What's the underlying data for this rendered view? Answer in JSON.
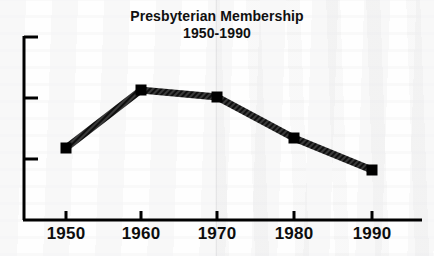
{
  "chart_data": {
    "type": "line",
    "title": "Presbyterian Membership",
    "subtitle": "1950-1990",
    "xlabel": "",
    "ylabel": "",
    "categories": [
      "1950",
      "1960",
      "1970",
      "1980",
      "1990"
    ],
    "x": [
      1950,
      1960,
      1970,
      1980,
      1990
    ],
    "values": [
      2.9,
      4.2,
      4.05,
      3.15,
      2.5
    ],
    "series": [
      {
        "name": "Presbyterian Membership",
        "values": [
          2.9,
          4.2,
          4.05,
          3.15,
          2.5
        ]
      }
    ],
    "xlim": [
      1945,
      1995
    ],
    "ylim": [
      1.8,
      4.8
    ],
    "y_tick_count": 3,
    "y_tick_labels": [],
    "grid": false,
    "legend": false,
    "legend_position": "none",
    "marker": "square",
    "line_style": "solid-hatched",
    "line_color": "#2b2b2b",
    "marker_color": "#000000",
    "axis_color": "#000000",
    "background_color": "#ffffff"
  },
  "axes": {
    "x_ticks": [
      {
        "label": "1950",
        "x_px": 66
      },
      {
        "label": "1960",
        "x_px": 141
      },
      {
        "label": "1970",
        "x_px": 217
      },
      {
        "label": "1980",
        "x_px": 294
      },
      {
        "label": "1990",
        "x_px": 372
      }
    ],
    "y_ticks": [
      {
        "label": "",
        "y_px": 37
      },
      {
        "label": "",
        "y_px": 98
      },
      {
        "label": "",
        "y_px": 159
      }
    ]
  },
  "points": [
    {
      "label": "1950",
      "x_px": 66,
      "y_px": 148
    },
    {
      "label": "1960",
      "x_px": 141,
      "y_px": 90
    },
    {
      "label": "1970",
      "x_px": 217,
      "y_px": 97
    },
    {
      "label": "1980",
      "x_px": 294,
      "y_px": 138
    },
    {
      "label": "1990",
      "x_px": 372,
      "y_px": 170
    }
  ]
}
